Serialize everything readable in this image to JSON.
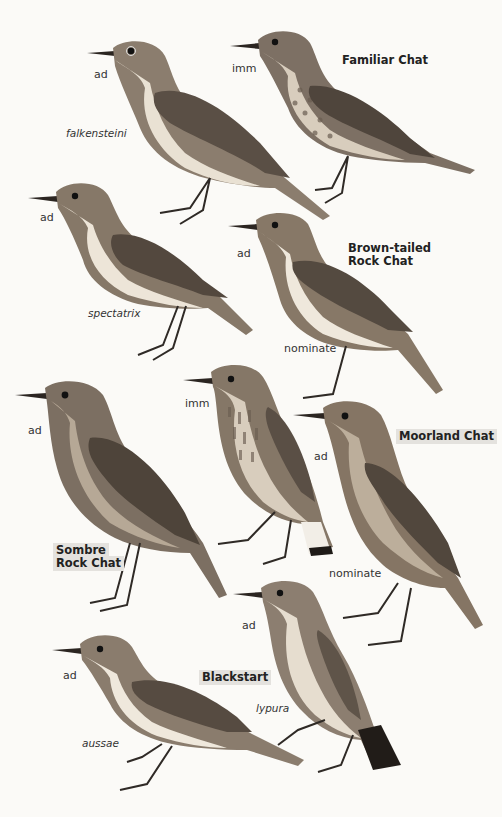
{
  "plate": {
    "background": "#fbfaf7",
    "colors": {
      "upperparts": "#8b7d6e",
      "wing": "#5a4f45",
      "underparts": "#e9e1d3",
      "throat": "#f3efe7",
      "legs": "#2f2a26",
      "tail_dark": "#2b2521",
      "label_highlight": "#e4e2de"
    }
  },
  "species": [
    {
      "name": "Familiar Chat",
      "highlighted": false,
      "figures": [
        {
          "age": "ad",
          "subspecies": "falkensteini"
        },
        {
          "age": "imm",
          "subspecies": ""
        }
      ]
    },
    {
      "name_line1": "Brown-tailed",
      "name_line2": "Rock Chat",
      "highlighted": false,
      "figures": [
        {
          "age": "ad",
          "subspecies": "spectatrix"
        },
        {
          "age": "ad",
          "subspecies": "nominate"
        }
      ]
    },
    {
      "name_line1": "Sombre",
      "name_line2": "Rock Chat",
      "highlighted": true,
      "figures": [
        {
          "age": "ad",
          "subspecies": ""
        }
      ]
    },
    {
      "name": "Moorland Chat",
      "highlighted": true,
      "figures": [
        {
          "age": "imm",
          "subspecies": ""
        },
        {
          "age": "ad",
          "subspecies": "nominate"
        }
      ]
    },
    {
      "name": "Blackstart",
      "highlighted": true,
      "figures": [
        {
          "age": "ad",
          "subspecies": "aussae"
        },
        {
          "age": "ad",
          "subspecies": "lypura"
        }
      ]
    }
  ]
}
